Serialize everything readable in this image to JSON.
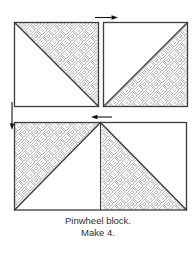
{
  "caption": {
    "line1": "Pinwheel block.",
    "line2": "Make 4."
  },
  "colors": {
    "outline": "#3c3c3c",
    "pattern_line": "#bcbcbc",
    "pattern_bg": "#f6f6f6",
    "arrow": "#111111",
    "text": "#2f2f2f",
    "background": "#ffffff"
  },
  "diagram": {
    "units": [
      {
        "name": "top-left-hst",
        "patterned_half": "upper-right",
        "diagonal": "top-left-to-bottom-right"
      },
      {
        "name": "top-right-hst",
        "patterned_half": "lower-right",
        "diagonal": "bottom-left-to-top-right"
      },
      {
        "name": "bottom-sewn-pair-left",
        "patterned_half": "upper-left",
        "diagonal": "bottom-left-to-top-center"
      },
      {
        "name": "bottom-sewn-pair-right",
        "patterned_half": "lower-left",
        "diagonal": "top-center-to-bottom-right"
      }
    ],
    "arrows": [
      {
        "name": "top-press-arrow",
        "direction": "right"
      },
      {
        "name": "left-press-arrow",
        "direction": "down"
      },
      {
        "name": "center-press-arrow",
        "direction": "left"
      }
    ]
  }
}
